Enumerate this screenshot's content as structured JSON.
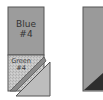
{
  "diagram": {
    "left_block": {
      "top_piece": {
        "name": "Blue",
        "number": "#4",
        "color": "#9c9c9c"
      },
      "bottom_piece": {
        "name": "Green",
        "number": "#4",
        "color": "#c4c4c4"
      },
      "strip_color": "#8a8a8a",
      "triangle_color": "#bdbdbd"
    },
    "right_block": {
      "main_color": "#9a9a9a",
      "triangle_color": "#2e2e2e"
    },
    "outline_color": "#555555"
  }
}
